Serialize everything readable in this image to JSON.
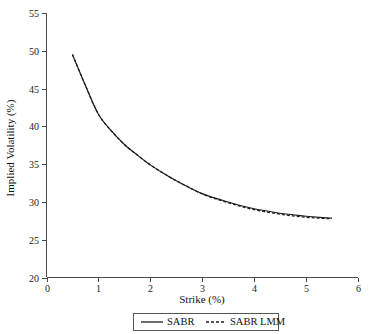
{
  "chart_data": {
    "type": "line",
    "title": "",
    "xlabel": "Strike (%)",
    "ylabel": "Implied Volatility (%)",
    "xlim": [
      0,
      6
    ],
    "ylim": [
      20,
      55
    ],
    "xticks": [
      0,
      1,
      2,
      3,
      4,
      5,
      6
    ],
    "xticklabels": [
      "0",
      "1",
      "2",
      "3",
      "4",
      "5",
      "6"
    ],
    "yticks": [
      20,
      25,
      30,
      35,
      40,
      45,
      50,
      55
    ],
    "yticklabels": [
      "20",
      "25",
      "30",
      "35",
      "40",
      "45",
      "50",
      "55"
    ],
    "grid": false,
    "legend_position": "below-axes",
    "x": [
      0.5,
      0.75,
      1.0,
      1.25,
      1.5,
      1.75,
      2.0,
      2.25,
      2.5,
      2.75,
      3.0,
      3.25,
      3.5,
      3.75,
      4.0,
      4.25,
      4.5,
      4.75,
      5.0,
      5.25,
      5.5
    ],
    "series": [
      {
        "name": "SABR",
        "style": "solid",
        "color": "#1c1c1c",
        "values": [
          49.5,
          45.4,
          41.6,
          39.4,
          37.6,
          36.2,
          34.9,
          33.8,
          32.8,
          31.9,
          31.1,
          30.5,
          30.0,
          29.5,
          29.1,
          28.8,
          28.5,
          28.3,
          28.1,
          27.95,
          27.85
        ]
      },
      {
        "name": "SABR LMM",
        "style": "dashed",
        "color": "#1c1c1c",
        "values": [
          49.5,
          45.4,
          41.6,
          39.4,
          37.6,
          36.2,
          34.9,
          33.8,
          32.8,
          31.9,
          31.05,
          30.42,
          29.9,
          29.4,
          28.98,
          28.65,
          28.38,
          28.15,
          27.98,
          27.85,
          27.78
        ]
      }
    ],
    "legend": [
      {
        "label": "SABR",
        "style": "solid"
      },
      {
        "label": "SABR LMM",
        "style": "dashed"
      }
    ]
  }
}
